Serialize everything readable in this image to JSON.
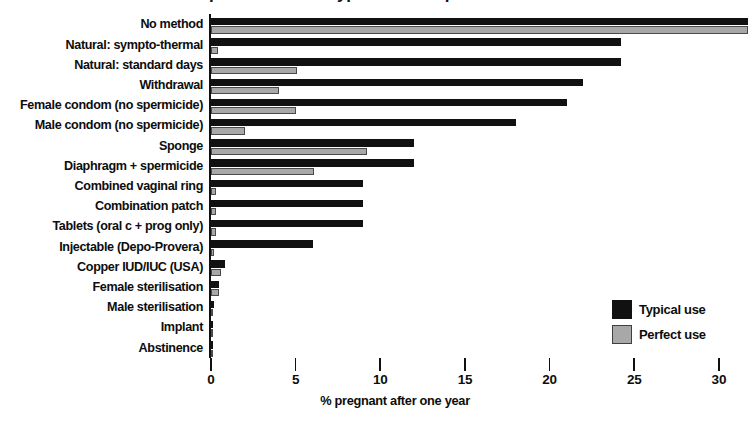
{
  "chart_data": {
    "type": "bar",
    "orientation": "horizontal",
    "title": "Effectiveness of contraceptive methods: typical use vs perfect use",
    "xlabel": "% pregnant after one year",
    "ylabel": "",
    "xlim": [
      0,
      30
    ],
    "xticks": [
      0,
      5,
      10,
      15,
      20,
      25,
      30
    ],
    "xtick_labels": [
      "0",
      "5",
      "10",
      "15",
      "20",
      "25",
      "30"
    ],
    "grid": false,
    "legend_position": "bottom-right",
    "categories": [
      "No method",
      "Natural: sympto-thermal",
      "Natural: standard days",
      "Withdrawal",
      "Female condom (no spermicide)",
      "Male condom (no spermicide)",
      "Sponge",
      "Diaphragm + spermicide",
      "Combined vaginal ring",
      "Combination patch",
      "Tablets (oral c + prog only)",
      "Injectable (Depo-Provera)",
      "Copper IUD/IUC (USA)",
      "Female sterilisation",
      "Male sterilisation",
      "Implant",
      "Abstinence"
    ],
    "series": [
      {
        "name": "Typical use",
        "color": "#111111",
        "values": [
          85,
          24.2,
          24.2,
          22,
          21,
          18,
          12,
          12,
          9,
          9,
          9,
          6,
          0.8,
          0.5,
          0.15,
          0.05,
          0.05
        ]
      },
      {
        "name": "Perfect use",
        "color": "#a8a8a8",
        "values": [
          85,
          0.4,
          5.1,
          4,
          5,
          2,
          9.2,
          6.1,
          0.3,
          0.3,
          0.3,
          0.2,
          0.6,
          0.5,
          0.1,
          0.05,
          0.05
        ]
      }
    ],
    "annotations": [
      {
        "category": "No method",
        "text": "85",
        "note": "value exceeds axis range; bar is truncated"
      }
    ]
  },
  "legend": {
    "items": [
      {
        "label": "Typical use",
        "swatch": "black-square-swatch"
      },
      {
        "label": "Perfect use",
        "swatch": "gray-square-swatch"
      }
    ]
  }
}
